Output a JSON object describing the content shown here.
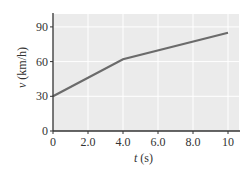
{
  "chart_data": {
    "type": "line",
    "title": "",
    "xlabel_var": "t",
    "xlabel_unit": " (s)",
    "ylabel_var": "v",
    "ylabel_unit": " (km/h)",
    "x": [
      0,
      4.0,
      10
    ],
    "series": [
      {
        "name": "v(t)",
        "values": [
          30,
          62,
          85
        ],
        "color": "#6b6b6b"
      }
    ],
    "xlim": [
      0,
      10.6
    ],
    "ylim": [
      0,
      101
    ],
    "xticks": [
      0,
      2.0,
      4.0,
      6.0,
      8.0,
      10
    ],
    "xtick_labels": [
      "0",
      "2.0",
      "4.0",
      "6.0",
      "8.0",
      "10"
    ],
    "yticks": [
      0,
      30,
      60,
      90
    ],
    "ytick_labels": [
      "0",
      "30",
      "60",
      "90"
    ],
    "grid": true,
    "legend": "none",
    "colors": {
      "plot_bg": "#ebebeb",
      "grid": "#ffffff",
      "axis": "#333333",
      "line": "#6b6b6b"
    }
  }
}
